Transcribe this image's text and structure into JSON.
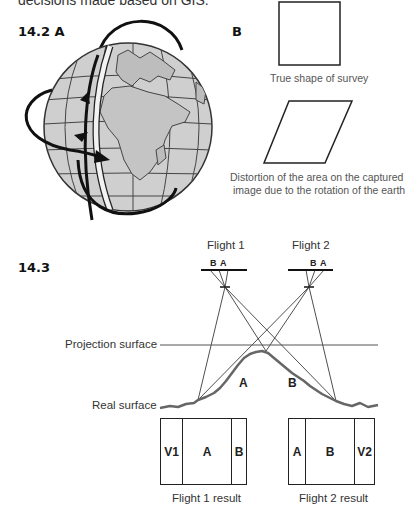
{
  "intro_text": "decisions made based on GIS.",
  "figure_14_2": {
    "label": "14.2 A",
    "panel_b_label": "B",
    "true_shape_caption": "True shape of survey",
    "distortion_caption_line1": "Distortion of the area on the captured",
    "distortion_caption_line2": "image due to the rotation of the earth",
    "icons": {
      "globe": "globe-icon",
      "orbit_arrows": "orbit-arrow-icon"
    }
  },
  "figure_14_3": {
    "label": "14.3",
    "flight1": {
      "title": "Flight 1",
      "sensor_labels": [
        "B",
        "A"
      ]
    },
    "flight2": {
      "title": "Flight 2",
      "sensor_labels": [
        "B",
        "A"
      ]
    },
    "projection_surface_label": "Projection surface",
    "real_surface_label": "Real surface",
    "slope_labels": [
      "A",
      "B"
    ],
    "results": [
      {
        "caption": "Flight 1 result",
        "cells": [
          "V1",
          "A",
          "B"
        ]
      },
      {
        "caption": "Flight 2 result",
        "cells": [
          "A",
          "B",
          "V2"
        ]
      }
    ]
  },
  "colors": {
    "globe_fill": "#c8c8c8",
    "line_dark": "#111111",
    "terrain": "#666666",
    "caption_gray": "#555555"
  }
}
